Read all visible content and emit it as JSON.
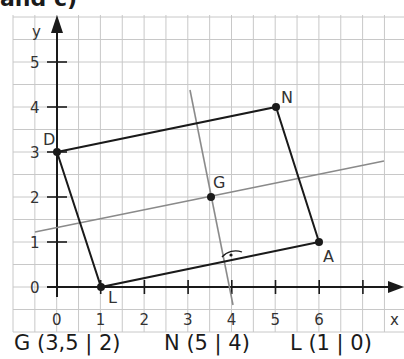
{
  "heading": "and c)",
  "axes": {
    "x_label": "x",
    "y_label": "y",
    "x_ticks": [
      "0",
      "1",
      "2",
      "3",
      "4",
      "5",
      "6"
    ],
    "y_ticks": [
      "0",
      "1",
      "2",
      "3",
      "4",
      "5"
    ]
  },
  "points": {
    "D": {
      "label": "D",
      "x": 0,
      "y": 3
    },
    "N": {
      "label": "N",
      "x": 5,
      "y": 4
    },
    "A": {
      "label": "A",
      "x": 6,
      "y": 1
    },
    "L": {
      "label": "L",
      "x": 1,
      "y": 0
    },
    "G": {
      "label": "G",
      "x": 3.5,
      "y": 2
    }
  },
  "rectangle": [
    "D",
    "N",
    "A",
    "L"
  ],
  "lines": [
    {
      "name": "gray-line-through-G",
      "from": [
        -0.5,
        1.25
      ],
      "to": [
        7.5,
        2.85
      ]
    },
    {
      "name": "perpendicular-line",
      "from": [
        3.05,
        4.4
      ],
      "to": [
        4.0,
        -0.4
      ]
    }
  ],
  "right_angle_marker": {
    "at": [
      3.78,
      0.56
    ]
  },
  "caption": {
    "g": "G (3,5 | 2)",
    "n": "N (5 | 4)",
    "l": "L (1 | 0)"
  },
  "colors": {
    "grid": "#c8c8c8",
    "axis": "#1a1a1a",
    "shape": "#1a1a1a",
    "aux_line": "#8a8a8a"
  }
}
